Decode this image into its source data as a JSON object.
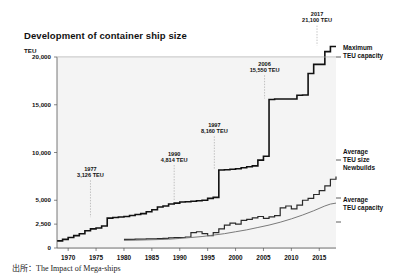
{
  "figure": {
    "title": "Development of container ship size",
    "unit_label": "TEU",
    "source_note": "出所：The Impact of Mega-ships"
  },
  "side_labels": {
    "maximum": "Maximum\nTEU capacity",
    "maximum_line1": "Maximum",
    "maximum_line2": "TEU capacity",
    "newbuilds_line1": "Average",
    "newbuilds_line2": "TEU size",
    "newbuilds_line3": "Newbuilds",
    "average_line1": "Average",
    "average_line2": "TEU capacity"
  },
  "chart_data": {
    "type": "line",
    "title": "Development of container ship size",
    "xlabel": "",
    "ylabel": "TEU",
    "xlim": [
      1968,
      2018
    ],
    "ylim": [
      0,
      20000
    ],
    "grid": true,
    "legend_position": "right-outside",
    "ytick_values": [
      0,
      2500,
      5000,
      10000,
      15000,
      20000
    ],
    "ytick_labels": [
      "0",
      "2,500",
      "5,000",
      "10,000",
      "15,000",
      "20,000"
    ],
    "xtick_values": [
      1970,
      1975,
      1980,
      1985,
      1990,
      1995,
      2000,
      2005,
      2010,
      2015
    ],
    "xtick_labels": [
      "1970",
      "1975",
      "1980",
      "1985",
      "1990",
      "1995",
      "2000",
      "2005",
      "2010",
      "2015"
    ],
    "annotations": [
      {
        "year": 1977,
        "value": 3126,
        "label_line1": "1977",
        "label_line2": "3,126 TEU",
        "lx": 1974.0,
        "ly": 7400
      },
      {
        "year": 1990,
        "value": 4814,
        "label_line1": "1990",
        "label_line2": "4,814 TEU",
        "lx": 1989.0,
        "ly": 9000
      },
      {
        "year": 1997,
        "value": 8160,
        "label_line1": "1997",
        "label_line2": "8,160 TEU",
        "lx": 1996.2,
        "ly": 12000
      },
      {
        "year": 2006,
        "value": 15550,
        "label_line1": "2006",
        "label_line2": "15,550 TEU",
        "lx": 2005.2,
        "ly": 18400
      },
      {
        "year": 2017,
        "value": 21100,
        "label_line1": "2017",
        "label_line2": "21,100 TEU",
        "lx": 2014.6,
        "ly": 23600
      }
    ],
    "series": [
      {
        "name": "Maximum TEU capacity",
        "style": "step",
        "color": "#111111",
        "width": 1.6,
        "x": [
          1968,
          1969,
          1970,
          1971,
          1972,
          1973,
          1974,
          1975,
          1976,
          1977,
          1978,
          1979,
          1980,
          1981,
          1982,
          1983,
          1984,
          1985,
          1986,
          1987,
          1988,
          1989,
          1990,
          1991,
          1992,
          1993,
          1994,
          1995,
          1996,
          1997,
          1998,
          1999,
          2000,
          2001,
          2002,
          2003,
          2004,
          2005,
          2006,
          2007,
          2008,
          2009,
          2010,
          2011,
          2012,
          2013,
          2014,
          2015,
          2016,
          2017,
          2018
        ],
        "values": [
          750,
          900,
          1100,
          1300,
          1500,
          1800,
          2000,
          2100,
          2300,
          3126,
          3200,
          3250,
          3300,
          3400,
          3500,
          3600,
          3800,
          4000,
          4300,
          4400,
          4600,
          4700,
          4814,
          4850,
          4900,
          4950,
          5000,
          5200,
          5300,
          8160,
          8200,
          8250,
          8300,
          8400,
          8500,
          8600,
          9200,
          9600,
          15550,
          15600,
          15600,
          15600,
          15600,
          16000,
          16020,
          18270,
          19224,
          19224,
          20568,
          21100,
          21100
        ]
      },
      {
        "name": "Average TEU size Newbuilds",
        "style": "step",
        "color": "#2a2a2a",
        "width": 1.2,
        "x": [
          1980,
          1981,
          1982,
          1983,
          1984,
          1985,
          1986,
          1987,
          1988,
          1989,
          1990,
          1991,
          1992,
          1993,
          1994,
          1995,
          1996,
          1997,
          1998,
          1999,
          2000,
          2001,
          2002,
          2003,
          2004,
          2005,
          2006,
          2007,
          2008,
          2009,
          2010,
          2011,
          2012,
          2013,
          2014,
          2015,
          2016,
          2017,
          2018
        ],
        "values": [
          900,
          900,
          920,
          930,
          950,
          960,
          980,
          1000,
          1050,
          1080,
          1100,
          1150,
          1600,
          1700,
          1500,
          1300,
          1600,
          2000,
          2400,
          2600,
          2500,
          2900,
          3000,
          3150,
          3300,
          3100,
          3250,
          3400,
          4200,
          4400,
          4100,
          4500,
          5000,
          5200,
          5600,
          6000,
          6500,
          7200,
          7500
        ]
      },
      {
        "name": "Average TEU capacity",
        "style": "line",
        "color": "#7a7a7a",
        "width": 1.0,
        "x": [
          1980,
          1982,
          1984,
          1986,
          1988,
          1990,
          1992,
          1994,
          1996,
          1998,
          2000,
          2002,
          2004,
          2006,
          2008,
          2010,
          2012,
          2014,
          2016,
          2017,
          2018
        ],
        "values": [
          800,
          820,
          850,
          880,
          920,
          1000,
          1100,
          1200,
          1350,
          1500,
          1700,
          1900,
          2150,
          2400,
          2700,
          3050,
          3450,
          3900,
          4400,
          4600,
          4700
        ]
      }
    ]
  }
}
